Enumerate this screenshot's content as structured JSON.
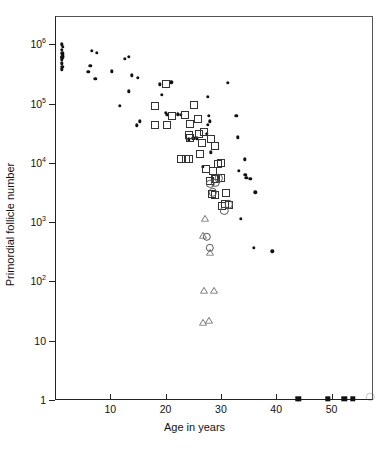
{
  "figure": {
    "title": "",
    "xlabel": "Age in years",
    "ylabel": "Primordial follicle number"
  },
  "axes": {
    "y_ticks": [
      {
        "label": "10",
        "exp": "6",
        "value": 1000000
      },
      {
        "label": "10",
        "exp": "5",
        "value": 100000
      },
      {
        "label": "10",
        "exp": "4",
        "value": 10000
      },
      {
        "label": "10",
        "exp": "3",
        "value": 1000
      },
      {
        "label": "10",
        "exp": "2",
        "value": 100
      },
      {
        "label": "10",
        "exp": "",
        "value": 10
      },
      {
        "label": "1",
        "exp": "",
        "value": 1
      }
    ],
    "x_ticks": [
      {
        "label": "10",
        "value": 10
      },
      {
        "label": "20",
        "value": 20
      },
      {
        "label": "30",
        "value": 30
      },
      {
        "label": "40",
        "value": 40
      },
      {
        "label": "50",
        "value": 50
      }
    ],
    "xlim": [
      0,
      57.5
    ],
    "ylim": [
      1,
      3000000
    ],
    "yscale": "log",
    "xscale": "linear",
    "grid": false,
    "legend": false
  },
  "chart_data": {
    "type": "scatter",
    "title": "",
    "xlabel": "Age in years",
    "ylabel": "Primordial follicle number",
    "xscale": "linear",
    "yscale": "log",
    "xlim": [
      0,
      57.5
    ],
    "ylim": [
      1,
      3000000
    ],
    "grid": false,
    "legend_position": "none",
    "series": [
      {
        "name": "filled-circle",
        "marker": "filled circle",
        "color": "#111111",
        "points": [
          [
            1.2,
            1000000
          ],
          [
            1.2,
            800000
          ],
          [
            1.3,
            700000
          ],
          [
            1.3,
            620000
          ],
          [
            1.2,
            560000
          ],
          [
            1.2,
            480000
          ],
          [
            1.3,
            420000
          ],
          [
            1.2,
            380000
          ],
          [
            1.4,
            900000
          ],
          [
            1.4,
            650000
          ],
          [
            1.35,
            600000
          ],
          [
            6.6,
            780000
          ],
          [
            7.6,
            720000
          ],
          [
            6.0,
            340000
          ],
          [
            6.4,
            430000
          ],
          [
            7.3,
            260000
          ],
          [
            10.3,
            350000
          ],
          [
            12.6,
            570000
          ],
          [
            13.3,
            610000
          ],
          [
            13.9,
            300000
          ],
          [
            15.0,
            270000
          ],
          [
            11.7,
            92000
          ],
          [
            13.3,
            160000
          ],
          [
            14.8,
            43000
          ],
          [
            15.3,
            50000
          ],
          [
            19.0,
            210000
          ],
          [
            19.3,
            140000
          ],
          [
            21.0,
            230000
          ],
          [
            20.0,
            70000
          ],
          [
            22.2,
            66000
          ],
          [
            22.8,
            64000
          ],
          [
            20.3,
            64000
          ],
          [
            24.2,
            25000
          ],
          [
            25.0,
            26000
          ],
          [
            25.6,
            26000
          ],
          [
            27.6,
            130000
          ],
          [
            27.8,
            62000
          ],
          [
            28.0,
            50000
          ],
          [
            27.6,
            44000
          ],
          [
            27.5,
            31000
          ],
          [
            26.7,
            8500
          ],
          [
            28.2,
            15000
          ],
          [
            31.2,
            225000
          ],
          [
            32.8,
            62000
          ],
          [
            33.0,
            27000
          ],
          [
            34.3,
            11500
          ],
          [
            33.2,
            7400
          ],
          [
            34.4,
            6300
          ],
          [
            34.6,
            5600
          ],
          [
            35.3,
            5400
          ],
          [
            36.2,
            3200
          ],
          [
            33.6,
            1150
          ],
          [
            36.0,
            370
          ],
          [
            39.3,
            320
          ],
          [
            44.0,
            1
          ]
        ]
      },
      {
        "name": "open-square",
        "marker": "open square",
        "color": "#333333",
        "points": [
          [
            20.1,
            210000
          ],
          [
            18.1,
            92000
          ],
          [
            20.2,
            43000
          ],
          [
            21.2,
            62000
          ],
          [
            18.0,
            44000
          ],
          [
            23.5,
            64000
          ],
          [
            24.5,
            46000
          ],
          [
            25.2,
            95000
          ],
          [
            25.8,
            56000
          ],
          [
            26.0,
            31000
          ],
          [
            24.3,
            30000
          ],
          [
            24.5,
            26000
          ],
          [
            27.0,
            33000
          ],
          [
            26.6,
            22000
          ],
          [
            26.2,
            14000
          ],
          [
            22.8,
            11500
          ],
          [
            23.6,
            11500
          ],
          [
            24.2,
            11500
          ],
          [
            28.2,
            25000
          ],
          [
            29.0,
            19000
          ],
          [
            29.4,
            9500
          ],
          [
            30.0,
            9800
          ],
          [
            28.6,
            7400
          ],
          [
            29.2,
            5300
          ],
          [
            28.0,
            5000
          ],
          [
            29.0,
            5400
          ],
          [
            30.0,
            5600
          ],
          [
            28.3,
            3000
          ],
          [
            29.0,
            2900
          ],
          [
            30.2,
            1850
          ],
          [
            31.5,
            1950
          ],
          [
            31.0,
            3100
          ],
          [
            30.8,
            2050
          ],
          [
            27.3,
            7900
          ]
        ]
      },
      {
        "name": "open-circle",
        "marker": "open circle",
        "color": "#555555",
        "points": [
          [
            28.1,
            4400
          ],
          [
            29.0,
            4600
          ],
          [
            30.6,
            1550
          ],
          [
            31.4,
            2000
          ],
          [
            28.5,
            3200
          ],
          [
            29.6,
            5500
          ],
          [
            28.0,
            370
          ],
          [
            27.5,
            560
          ]
        ]
      },
      {
        "name": "open-triangle",
        "marker": "open triangle",
        "color": "#666666",
        "points": [
          [
            27.8,
            1100
          ],
          [
            27.4,
            560
          ],
          [
            28.8,
            290
          ],
          [
            27.6,
            66
          ],
          [
            29.4,
            66
          ],
          [
            27.4,
            19
          ],
          [
            28.6,
            21
          ]
        ]
      },
      {
        "name": "zero-axis-filled-square",
        "marker": "filled square",
        "color": "#111111",
        "points": [
          [
            44.0,
            1
          ],
          [
            49.3,
            1
          ],
          [
            52.3,
            1
          ],
          [
            53.8,
            1
          ]
        ]
      }
    ]
  }
}
